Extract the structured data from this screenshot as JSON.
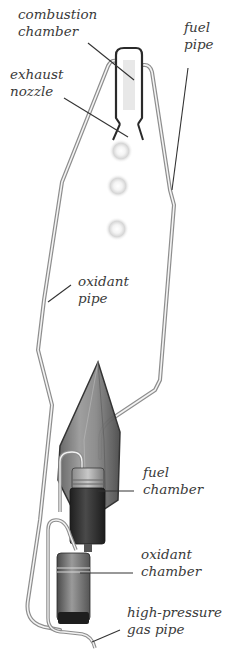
{
  "diagram": {
    "labels": {
      "combustion_chamber": {
        "line1": "combustion",
        "line2": "chamber"
      },
      "fuel_pipe": {
        "line1": "fuel",
        "line2": "pipe"
      },
      "exhaust_nozzle": {
        "line1": "exhaust",
        "line2": "nozzle"
      },
      "oxidant_pipe": {
        "line1": "oxidant",
        "line2": "pipe"
      },
      "fuel_chamber": {
        "line1": "fuel",
        "line2": "chamber"
      },
      "oxidant_chamber": {
        "line1": "oxidant",
        "line2": "chamber"
      },
      "gas_pipe": {
        "line1": "high-pressure",
        "line2": "gas pipe"
      }
    },
    "colors": {
      "background": "#ffffff",
      "pipe": "#9a9a9a",
      "pipe_highlight": "#f2f2f2",
      "chamber_dark": "#2e2e2e",
      "chamber_mid": "#7a7a7a",
      "nose_cone": "#6e6e6e",
      "text": "#3a3a3a",
      "leader": "#333333"
    }
  }
}
